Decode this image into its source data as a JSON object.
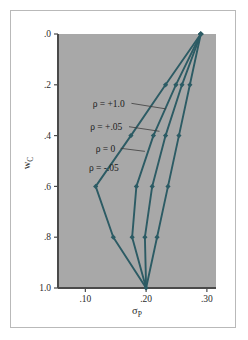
{
  "figure": {
    "name": "portfolio-frontier-chart",
    "background_color": "#ffffff",
    "border_color": "#b9b9b9",
    "plot_background_color": "#a8a8a8",
    "plot_border_color": "#4a4a4a",
    "line_color": "#2c5b64",
    "leader_color": "#3c3c3c"
  },
  "chart_data": {
    "type": "line",
    "title": "",
    "subtitle": "",
    "xlabel": "σP",
    "xlabel_base": "σ",
    "xlabel_sub": "P",
    "ylabel": "wC",
    "ylabel_base": "w",
    "ylabel_sub": "C",
    "xlim": [
      0.055,
      0.315
    ],
    "ylim": [
      0.0,
      1.0
    ],
    "y_inverted": true,
    "grid": false,
    "legend_position": "inline-annotations",
    "xticks": [
      0.1,
      0.2,
      0.3
    ],
    "xtick_labels": [
      ".10",
      ".20",
      ".30"
    ],
    "yticks": [
      0.0,
      0.2,
      0.4,
      0.6,
      0.8,
      1.0
    ],
    "ytick_labels": [
      ".0",
      ".2",
      ".4",
      ".6",
      ".8",
      "1.0"
    ],
    "marker": "diamond",
    "series": [
      {
        "name": "ρ = +1.0",
        "label": "ρ = +1.0",
        "x": [
          0.29,
          0.272,
          0.254,
          0.236,
          0.218,
          0.2
        ],
        "y": [
          0.0,
          0.2,
          0.4,
          0.6,
          0.8,
          1.0
        ]
      },
      {
        "name": "ρ = +.05",
        "label": "ρ = +.05",
        "x": [
          0.29,
          0.259,
          0.232,
          0.21,
          0.198,
          0.2
        ],
        "y": [
          0.0,
          0.2,
          0.4,
          0.6,
          0.8,
          1.0
        ]
      },
      {
        "name": "ρ = 0",
        "label": "ρ = 0",
        "x": [
          0.29,
          0.249,
          0.212,
          0.184,
          0.177,
          0.2
        ],
        "y": [
          0.0,
          0.2,
          0.4,
          0.6,
          0.8,
          1.0
        ]
      },
      {
        "name": "ρ = -.05",
        "label": "ρ = -.05",
        "x": [
          0.29,
          0.232,
          0.175,
          0.117,
          0.146,
          0.2
        ],
        "y": [
          0.0,
          0.2,
          0.4,
          0.6,
          0.8,
          1.0
        ]
      }
    ],
    "annotations": [
      {
        "text": "ρ = +1.0",
        "x": 0.112,
        "y": 0.273,
        "leader_to_x": 0.233,
        "leader_to_y": 0.295
      },
      {
        "text": "ρ = +.05",
        "x": 0.108,
        "y": 0.365,
        "leader_to_x": 0.222,
        "leader_to_y": 0.383
      },
      {
        "text": "ρ = 0",
        "x": 0.117,
        "y": 0.45,
        "leader_to_x": 0.198,
        "leader_to_y": 0.462
      },
      {
        "text": "ρ = -.05",
        "x": 0.106,
        "y": 0.528,
        "leader_to_x": null,
        "leader_to_y": null
      }
    ]
  }
}
